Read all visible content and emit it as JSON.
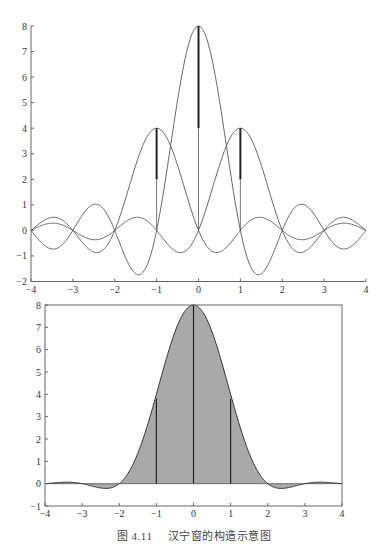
{
  "caption": {
    "figure_number": "图 4.11",
    "title": "汉宁窗的构造示意图"
  },
  "colors": {
    "line": "#555555",
    "axis": "#666666",
    "fill": "#a9a9a9",
    "stem": "#222222",
    "text": "#333333"
  },
  "chart_data": [
    {
      "type": "line",
      "title": "",
      "xlabel": "",
      "ylabel": "",
      "xlim": [
        -4,
        4
      ],
      "ylim": [
        -2,
        8
      ],
      "xticks": [
        -4,
        -3,
        -2,
        -1,
        0,
        1,
        2,
        3,
        4
      ],
      "yticks": [
        -2,
        -1,
        0,
        1,
        2,
        3,
        4,
        5,
        6,
        7,
        8
      ],
      "xtick_labels": [
        "−4",
        "−3",
        "−2",
        "−1",
        "0",
        "1",
        "2",
        "3",
        "4"
      ],
      "ytick_labels": [
        "−2",
        "−1",
        "0",
        "1",
        "2",
        "3",
        "4",
        "5",
        "6",
        "7",
        "8"
      ],
      "grid": false,
      "legend": null,
      "frame": "left-bottom",
      "series": [
        {
          "name": "center kernel 8·sinc(x)",
          "amplitude": 8,
          "shift": 0,
          "x": [
            -4,
            -3.5,
            -3,
            -2.5,
            -2,
            -1.5,
            -1,
            -0.5,
            0,
            0.5,
            1,
            1.5,
            2,
            2.5,
            3,
            3.5,
            4
          ],
          "values": [
            0,
            -0.73,
            0,
            1.02,
            0,
            -1.7,
            0,
            5.09,
            8,
            5.09,
            0,
            -1.7,
            0,
            1.02,
            0,
            -0.73,
            0
          ]
        },
        {
          "name": "left kernel 4·sinc(x+1)",
          "amplitude": 4,
          "shift": -1,
          "x": [
            -4,
            -3.5,
            -3,
            -2.5,
            -2,
            -1.5,
            -1,
            -0.5,
            0,
            0.5,
            1,
            1.5,
            2,
            2.5,
            3,
            3.5,
            4
          ],
          "values": [
            0,
            0.51,
            0,
            -0.85,
            0,
            2.55,
            4,
            2.55,
            0,
            -0.85,
            0,
            0.51,
            0,
            -0.36,
            0,
            0.28,
            0
          ]
        },
        {
          "name": "right kernel 4·sinc(x−1)",
          "amplitude": 4,
          "shift": 1,
          "x": [
            -4,
            -3.5,
            -3,
            -2.5,
            -2,
            -1.5,
            -1,
            -0.5,
            0,
            0.5,
            1,
            1.5,
            2,
            2.5,
            3,
            3.5,
            4
          ],
          "values": [
            0,
            0.28,
            0,
            -0.36,
            0,
            0.51,
            0,
            -0.85,
            0,
            2.55,
            4,
            2.55,
            0,
            -0.85,
            0,
            0.51,
            0
          ]
        }
      ],
      "stems": [
        {
          "x": -1,
          "y": 4
        },
        {
          "x": 0,
          "y": 8
        },
        {
          "x": 1,
          "y": 4
        }
      ]
    },
    {
      "type": "area",
      "title": "",
      "xlabel": "",
      "ylabel": "",
      "xlim": [
        -4,
        4
      ],
      "ylim": [
        -1,
        8
      ],
      "xticks": [
        -4,
        -3,
        -2,
        -1,
        0,
        1,
        2,
        3,
        4
      ],
      "yticks": [
        -1,
        0,
        1,
        2,
        3,
        4,
        5,
        6,
        7,
        8
      ],
      "xtick_labels": [
        "−4",
        "−3",
        "−2",
        "−1",
        "0",
        "1",
        "2",
        "3",
        "4"
      ],
      "ytick_labels": [
        "−1",
        "0",
        "1",
        "2",
        "3",
        "4",
        "5",
        "6",
        "7",
        "8"
      ],
      "grid": false,
      "legend": null,
      "frame": "box",
      "series": [
        {
          "name": "Hanning window sum 8·sinc(x)+4·sinc(x−1)+4·sinc(x+1)",
          "x": [
            -4,
            -3.5,
            -3,
            -2.5,
            -2,
            -1.5,
            -1,
            -0.5,
            0,
            0.5,
            1,
            1.5,
            2,
            2.5,
            3,
            3.5,
            4
          ],
          "values": [
            0,
            0.06,
            0,
            -0.19,
            0,
            1.36,
            4,
            6.79,
            8,
            6.79,
            4,
            1.36,
            0,
            -0.19,
            0,
            0.06,
            0
          ]
        }
      ],
      "stems": [
        {
          "x": -1,
          "y": 3.8
        },
        {
          "x": 0,
          "y": 8
        },
        {
          "x": 1,
          "y": 3.8
        }
      ]
    }
  ]
}
